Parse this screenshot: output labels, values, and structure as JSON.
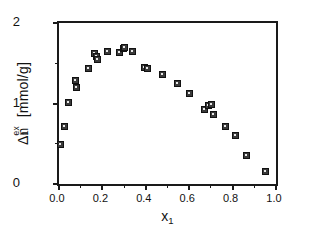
{
  "figure": {
    "background_color": "#ffffff",
    "axis_color": "#1a1a1a",
    "marker_color": "#3a3a3a",
    "marker_edge_color": "#111111"
  },
  "axis_titles": {
    "y_delta": "Δ",
    "y_n": "n",
    "y_sub": "1",
    "y_sup": "ex",
    "y_units": " [mmol/g]",
    "y_full": "Δn1ex [mmol/g]",
    "x_var": "x",
    "x_sub": "1",
    "x_full": "x1"
  },
  "ticks": {
    "y_major_labels": [
      "0",
      "1",
      "2"
    ],
    "y_major_values": [
      0,
      1,
      2
    ],
    "y_minor_values": [
      0.5,
      1.5
    ],
    "x_major_labels": [
      "0.0",
      "0.2",
      "0.4",
      "0.6",
      "0.8",
      "1.0"
    ],
    "x_major_values": [
      0.0,
      0.2,
      0.4,
      0.6,
      0.8,
      1.0
    ],
    "x_minor_values": [
      0.1,
      0.3,
      0.5,
      0.7,
      0.9
    ]
  },
  "chart_data": {
    "type": "scatter",
    "title": "",
    "subtitle": "",
    "xlabel": "x1",
    "ylabel": "Δn1ex [mmol/g]",
    "xlim": [
      0.0,
      1.0
    ],
    "ylim": [
      0.0,
      2.0
    ],
    "grid": false,
    "legend": null,
    "marker": "square",
    "series": [
      {
        "name": "excess adsorption",
        "x": [
          0.005,
          0.025,
          0.045,
          0.075,
          0.082,
          0.135,
          0.163,
          0.172,
          0.178,
          0.222,
          0.278,
          0.295,
          0.302,
          0.34,
          0.395,
          0.408,
          0.478,
          0.545,
          0.602,
          0.672,
          0.688,
          0.702,
          0.71,
          0.768,
          0.812,
          0.862,
          0.952
        ],
        "y": [
          0.49,
          0.72,
          1.01,
          1.28,
          1.2,
          1.44,
          1.62,
          1.58,
          1.55,
          1.65,
          1.63,
          1.68,
          1.7,
          1.64,
          1.45,
          1.43,
          1.36,
          1.25,
          1.13,
          0.93,
          0.97,
          0.99,
          0.86,
          0.72,
          0.6,
          0.35,
          0.15
        ]
      }
    ]
  }
}
